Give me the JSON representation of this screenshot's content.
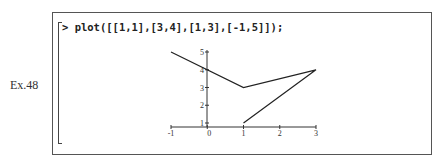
{
  "example_label": "Ex.48",
  "worksheet": {
    "prompt": ">",
    "command": "plot([[1,1],[3,4],[1,3],[-1,5]]);"
  },
  "chart_data": {
    "type": "line",
    "title": "",
    "xlabel": "",
    "ylabel": "",
    "x": [
      1,
      3,
      1,
      -1
    ],
    "y": [
      1,
      4,
      3,
      5
    ],
    "points": [
      [
        1,
        1
      ],
      [
        3,
        4
      ],
      [
        1,
        3
      ],
      [
        -1,
        5
      ]
    ],
    "xlim": [
      -1,
      3
    ],
    "ylim": [
      1,
      5
    ],
    "x_ticks": [
      "-1",
      "0",
      "1",
      "2",
      "3"
    ],
    "y_ticks": [
      "1",
      "2",
      "3",
      "4",
      "5"
    ],
    "grid": false,
    "legend": null
  }
}
